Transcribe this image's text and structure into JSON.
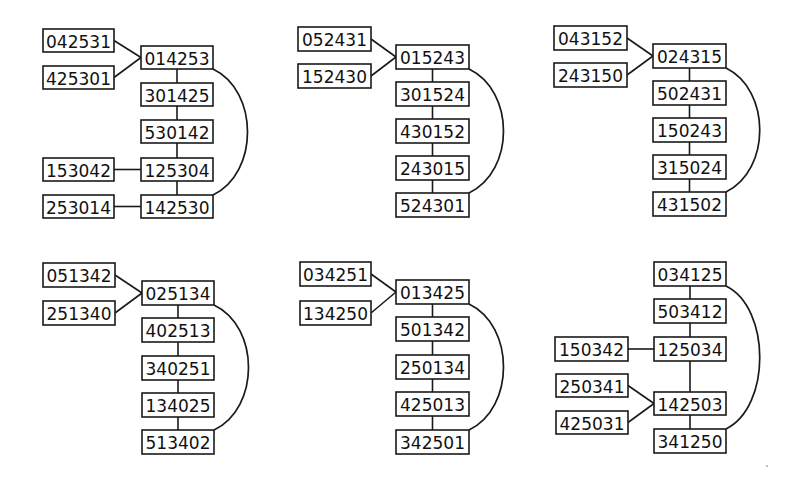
{
  "colors": {
    "background": "#ffffff",
    "stroke": "#1a1a1a",
    "text": "#111111"
  },
  "graphs": [
    {
      "id": "graph-1",
      "nodes": [
        {
          "id": "a",
          "label": "042531",
          "x": 43,
          "y": 29,
          "w": 71,
          "h": 23
        },
        {
          "id": "b",
          "label": "425301",
          "x": 43,
          "y": 66,
          "w": 71,
          "h": 23
        },
        {
          "id": "c",
          "label": "014253",
          "x": 141,
          "y": 46,
          "w": 72,
          "h": 23
        },
        {
          "id": "d",
          "label": "301425",
          "x": 141,
          "y": 83,
          "w": 72,
          "h": 23
        },
        {
          "id": "e",
          "label": "530142",
          "x": 141,
          "y": 120,
          "w": 72,
          "h": 23
        },
        {
          "id": "f",
          "label": "153042",
          "x": 43,
          "y": 158,
          "w": 71,
          "h": 23
        },
        {
          "id": "g",
          "label": "125304",
          "x": 141,
          "y": 158,
          "w": 72,
          "h": 23
        },
        {
          "id": "h",
          "label": "253014",
          "x": 43,
          "y": 195,
          "w": 71,
          "h": 23
        },
        {
          "id": "i",
          "label": "142530",
          "x": 141,
          "y": 195,
          "w": 72,
          "h": 23
        }
      ],
      "edges": [
        [
          "a",
          "c"
        ],
        [
          "b",
          "c"
        ],
        [
          "c",
          "d"
        ],
        [
          "d",
          "e"
        ],
        [
          "e",
          "g"
        ],
        [
          "f",
          "g"
        ],
        [
          "g",
          "i"
        ],
        [
          "h",
          "i"
        ]
      ],
      "arc": {
        "from": "c",
        "to": "i",
        "bulge_x": 253
      }
    },
    {
      "id": "graph-2",
      "nodes": [
        {
          "id": "a",
          "label": "052431",
          "x": 298,
          "y": 27,
          "w": 73,
          "h": 24
        },
        {
          "id": "b",
          "label": "152430",
          "x": 298,
          "y": 64,
          "w": 73,
          "h": 24
        },
        {
          "id": "c",
          "label": "015243",
          "x": 396,
          "y": 45,
          "w": 73,
          "h": 24
        },
        {
          "id": "d",
          "label": "301524",
          "x": 396,
          "y": 82,
          "w": 73,
          "h": 24
        },
        {
          "id": "e",
          "label": "430152",
          "x": 396,
          "y": 119,
          "w": 73,
          "h": 24
        },
        {
          "id": "f",
          "label": "243015",
          "x": 396,
          "y": 156,
          "w": 73,
          "h": 24
        },
        {
          "id": "g",
          "label": "524301",
          "x": 396,
          "y": 193,
          "w": 73,
          "h": 24
        }
      ],
      "edges": [
        [
          "a",
          "c"
        ],
        [
          "b",
          "c"
        ],
        [
          "c",
          "d"
        ],
        [
          "d",
          "e"
        ],
        [
          "e",
          "f"
        ],
        [
          "f",
          "g"
        ]
      ],
      "arc": {
        "from": "c",
        "to": "g",
        "bulge_x": 509
      }
    },
    {
      "id": "graph-3",
      "nodes": [
        {
          "id": "a",
          "label": "043152",
          "x": 554,
          "y": 26,
          "w": 73,
          "h": 24
        },
        {
          "id": "b",
          "label": "243150",
          "x": 554,
          "y": 63,
          "w": 73,
          "h": 24
        },
        {
          "id": "c",
          "label": "024315",
          "x": 653,
          "y": 44,
          "w": 73,
          "h": 24
        },
        {
          "id": "d",
          "label": "502431",
          "x": 653,
          "y": 81,
          "w": 73,
          "h": 24
        },
        {
          "id": "e",
          "label": "150243",
          "x": 653,
          "y": 118,
          "w": 73,
          "h": 24
        },
        {
          "id": "f",
          "label": "315024",
          "x": 653,
          "y": 155,
          "w": 73,
          "h": 24
        },
        {
          "id": "g",
          "label": "431502",
          "x": 653,
          "y": 192,
          "w": 73,
          "h": 24
        }
      ],
      "edges": [
        [
          "a",
          "c"
        ],
        [
          "b",
          "c"
        ],
        [
          "c",
          "d"
        ],
        [
          "d",
          "e"
        ],
        [
          "e",
          "f"
        ],
        [
          "f",
          "g"
        ]
      ],
      "arc": {
        "from": "c",
        "to": "g",
        "bulge_x": 765
      }
    },
    {
      "id": "graph-4",
      "nodes": [
        {
          "id": "a",
          "label": "051342",
          "x": 43,
          "y": 263,
          "w": 72,
          "h": 24
        },
        {
          "id": "b",
          "label": "251340",
          "x": 43,
          "y": 301,
          "w": 72,
          "h": 24
        },
        {
          "id": "c",
          "label": "025134",
          "x": 142,
          "y": 281,
          "w": 72,
          "h": 24
        },
        {
          "id": "d",
          "label": "402513",
          "x": 142,
          "y": 318,
          "w": 72,
          "h": 24
        },
        {
          "id": "e",
          "label": "340251",
          "x": 142,
          "y": 356,
          "w": 72,
          "h": 24
        },
        {
          "id": "f",
          "label": "134025",
          "x": 142,
          "y": 393,
          "w": 72,
          "h": 24
        },
        {
          "id": "g",
          "label": "513402",
          "x": 142,
          "y": 430,
          "w": 72,
          "h": 24
        }
      ],
      "edges": [
        [
          "a",
          "c"
        ],
        [
          "b",
          "c"
        ],
        [
          "c",
          "d"
        ],
        [
          "d",
          "e"
        ],
        [
          "e",
          "f"
        ],
        [
          "f",
          "g"
        ]
      ],
      "arc": {
        "from": "c",
        "to": "g",
        "bulge_x": 254
      }
    },
    {
      "id": "graph-5",
      "nodes": [
        {
          "id": "a",
          "label": "034251",
          "x": 300,
          "y": 262,
          "w": 71,
          "h": 24
        },
        {
          "id": "b",
          "label": "134250",
          "x": 300,
          "y": 301,
          "w": 71,
          "h": 24
        },
        {
          "id": "c",
          "label": "013425",
          "x": 396,
          "y": 280,
          "w": 73,
          "h": 24
        },
        {
          "id": "d",
          "label": "501342",
          "x": 396,
          "y": 317,
          "w": 73,
          "h": 24
        },
        {
          "id": "e",
          "label": "250134",
          "x": 396,
          "y": 355,
          "w": 73,
          "h": 24
        },
        {
          "id": "f",
          "label": "425013",
          "x": 396,
          "y": 392,
          "w": 73,
          "h": 24
        },
        {
          "id": "g",
          "label": "342501",
          "x": 396,
          "y": 430,
          "w": 73,
          "h": 24
        }
      ],
      "edges": [
        [
          "a",
          "c"
        ],
        [
          "b",
          "c"
        ],
        [
          "c",
          "d"
        ],
        [
          "d",
          "e"
        ],
        [
          "e",
          "f"
        ],
        [
          "f",
          "g"
        ]
      ],
      "arc": {
        "from": "c",
        "to": "g",
        "bulge_x": 509
      }
    },
    {
      "id": "graph-6",
      "nodes": [
        {
          "id": "a",
          "label": "034125",
          "x": 654,
          "y": 262,
          "w": 72,
          "h": 24
        },
        {
          "id": "b",
          "label": "503412",
          "x": 654,
          "y": 299,
          "w": 72,
          "h": 24
        },
        {
          "id": "c",
          "label": "150342",
          "x": 555,
          "y": 337,
          "w": 73,
          "h": 24
        },
        {
          "id": "d",
          "label": "125034",
          "x": 654,
          "y": 337,
          "w": 72,
          "h": 24
        },
        {
          "id": "e",
          "label": "250341",
          "x": 556,
          "y": 374,
          "w": 72,
          "h": 23
        },
        {
          "id": "f",
          "label": "425031",
          "x": 556,
          "y": 411,
          "w": 72,
          "h": 23
        },
        {
          "id": "g",
          "label": "142503",
          "x": 654,
          "y": 392,
          "w": 72,
          "h": 23
        },
        {
          "id": "h",
          "label": "341250",
          "x": 654,
          "y": 429,
          "w": 72,
          "h": 24
        }
      ],
      "edges": [
        [
          "a",
          "b"
        ],
        [
          "b",
          "d"
        ],
        [
          "c",
          "d"
        ],
        [
          "d",
          "g"
        ],
        [
          "e",
          "g"
        ],
        [
          "f",
          "g"
        ],
        [
          "g",
          "h"
        ]
      ],
      "arc": {
        "from": "a",
        "to": "h",
        "bulge_x": 765
      }
    }
  ]
}
